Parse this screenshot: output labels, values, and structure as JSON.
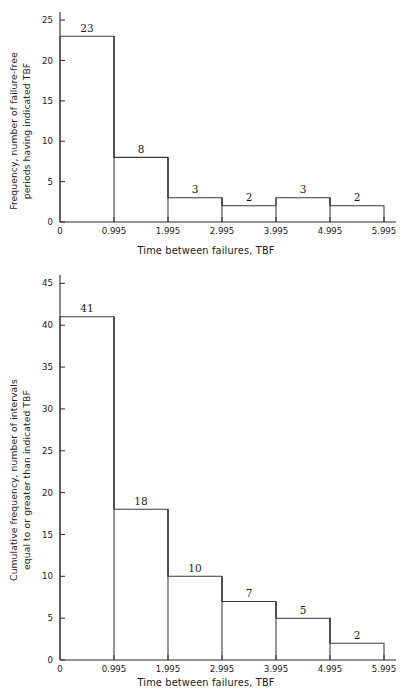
{
  "figure": {
    "background": "#ffffff",
    "line_color": "#3a3a3a"
  },
  "charts": [
    {
      "id": "frequency-histogram",
      "chart_data": {
        "type": "bar",
        "title": "",
        "xlabel": "Time between failures, TBF",
        "ylabel": "Frequency, number of failure-free periods having indicated TBF",
        "ylabel_lines": [
          "Frequency, number of failure-free",
          "periods having indicated TBF"
        ],
        "categories": [
          "0-0.995",
          "0.995-1.995",
          "1.995-2.995",
          "2.995-3.995",
          "3.995-4.995",
          "4.995-5.995"
        ],
        "bin_edges": [
          "0",
          "0.995",
          "1.995",
          "2.995",
          "3.995",
          "4.995",
          "5.995"
        ],
        "values": [
          23,
          8,
          3,
          2,
          3,
          2
        ],
        "bar_labels": [
          "23",
          "8",
          "3",
          "2",
          "3",
          "2"
        ],
        "xticks": [
          "0",
          "0.995",
          "1.995",
          "2.995",
          "3.995",
          "4.995",
          "5.995"
        ],
        "yticks": [
          "0",
          "5",
          "10",
          "15",
          "20",
          "25"
        ],
        "ytick_values": [
          0,
          5,
          10,
          15,
          20,
          25
        ],
        "ylim": [
          0,
          26
        ],
        "xlim": [
          0,
          5.995
        ],
        "grid": false,
        "legend": false
      }
    },
    {
      "id": "cumulative-frequency-histogram",
      "chart_data": {
        "type": "bar",
        "title": "",
        "xlabel": "Time between failures, TBF",
        "ylabel": "Cumulative frequency, number of intervals equal to or greater than indicated TBF",
        "ylabel_lines": [
          "Cumulative frequency, number of intervals",
          "equal to or greater than indicated TBF"
        ],
        "categories": [
          "0-0.995",
          "0.995-1.995",
          "1.995-2.995",
          "2.995-3.995",
          "3.995-4.995",
          "4.995-5.995"
        ],
        "bin_edges": [
          "0",
          "0.995",
          "1.995",
          "2.995",
          "3.995",
          "4.995",
          "5.995"
        ],
        "values": [
          41,
          18,
          10,
          7,
          5,
          2
        ],
        "bar_labels": [
          "41",
          "18",
          "10",
          "7",
          "5",
          "2"
        ],
        "xticks": [
          "0",
          "0.995",
          "1.995",
          "2.995",
          "3.995",
          "4.995",
          "5.995"
        ],
        "yticks": [
          "0",
          "5",
          "10",
          "15",
          "20",
          "25",
          "30",
          "35",
          "40",
          "45"
        ],
        "ytick_values": [
          0,
          5,
          10,
          15,
          20,
          25,
          30,
          35,
          40,
          45
        ],
        "ylim": [
          0,
          46
        ],
        "xlim": [
          0,
          5.995
        ],
        "grid": false,
        "legend": false
      }
    }
  ]
}
